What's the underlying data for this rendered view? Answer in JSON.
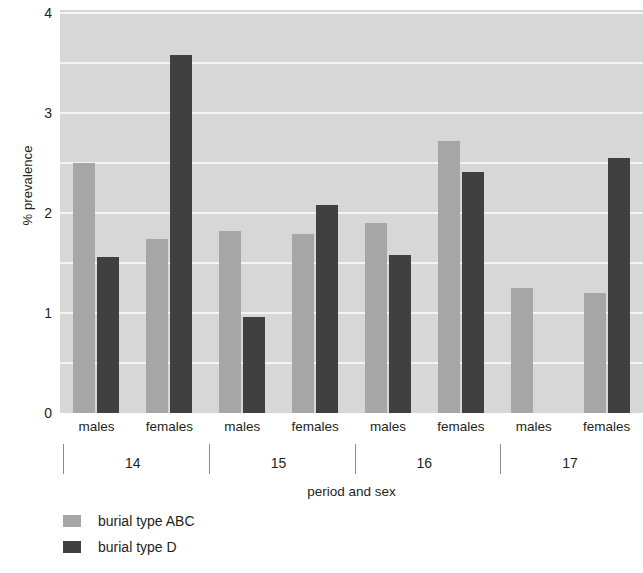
{
  "chart_data": {
    "type": "bar",
    "title": "",
    "xlabel": "period and sex",
    "ylabel": "% prevalence",
    "ylim": [
      0,
      4
    ],
    "yticks": [
      0,
      1,
      2,
      3,
      4
    ],
    "ytick_labels": [
      "0",
      "1",
      "2",
      "3",
      "4"
    ],
    "grid": true,
    "grid_minor_step": 0.5,
    "legend_position": "below-left",
    "group_labels": [
      "14",
      "15",
      "16",
      "17"
    ],
    "group_title": "period",
    "categories": [
      "14 males",
      "14 females",
      "15 males",
      "15 females",
      "16 males",
      "16 females",
      "17 males",
      "17 females"
    ],
    "sex_labels": [
      "males",
      "females",
      "males",
      "females",
      "males",
      "females",
      "males",
      "females"
    ],
    "series": [
      {
        "name": "burial type ABC",
        "color": "#a6a6a6",
        "values": [
          2.5,
          1.74,
          1.82,
          1.79,
          1.9,
          2.72,
          1.25,
          1.2
        ]
      },
      {
        "name": "burial type D",
        "color": "#404040",
        "values": [
          1.56,
          3.58,
          0.96,
          2.08,
          1.58,
          2.41,
          null,
          2.55
        ]
      }
    ]
  },
  "legend": {
    "items": [
      {
        "label": "burial type ABC",
        "color": "#a6a6a6"
      },
      {
        "label": "burial type D",
        "color": "#404040"
      }
    ]
  },
  "colors": {
    "plot_background": "#d7d7d7",
    "gridline": "#f4f4f4",
    "series_abc": "#a6a6a6",
    "series_d": "#404040",
    "text": "#231f20",
    "separator": "#8c8c8c"
  }
}
